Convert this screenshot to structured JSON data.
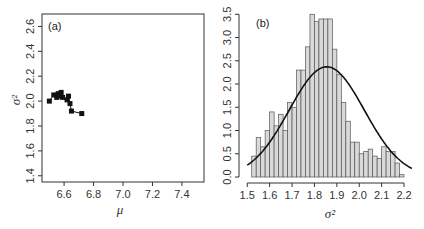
{
  "chart_data": [
    {
      "type": "scatter",
      "panel_label": "(a)",
      "title": "",
      "xlabel": "μ",
      "ylabel": "σ²",
      "xlim": [
        6.45,
        7.55
      ],
      "ylim": [
        1.35,
        2.7
      ],
      "xticks": [
        6.6,
        6.8,
        7.0,
        7.2,
        7.4
      ],
      "xtick_labels": [
        "6.6",
        "6.8",
        "7.0",
        "7.2",
        "7.4"
      ],
      "yticks": [
        1.4,
        1.6,
        1.8,
        2.0,
        2.2,
        2.4,
        2.6
      ],
      "ytick_labels": [
        "1.4",
        "1.6",
        "1.8",
        "2.0",
        "2.2",
        "2.4",
        "2.6"
      ],
      "grid": false,
      "marker": "square",
      "connected": true,
      "points": [
        {
          "x": 6.5,
          "y": 2.0
        },
        {
          "x": 6.53,
          "y": 2.05
        },
        {
          "x": 6.55,
          "y": 2.03
        },
        {
          "x": 6.56,
          "y": 2.06
        },
        {
          "x": 6.57,
          "y": 2.04
        },
        {
          "x": 6.58,
          "y": 2.07
        },
        {
          "x": 6.59,
          "y": 2.03
        },
        {
          "x": 6.62,
          "y": 2.01
        },
        {
          "x": 6.63,
          "y": 2.04
        },
        {
          "x": 6.64,
          "y": 1.98
        },
        {
          "x": 6.65,
          "y": 1.92
        },
        {
          "x": 6.72,
          "y": 1.9
        }
      ]
    },
    {
      "type": "bar",
      "subtype": "histogram",
      "panel_label": "(b)",
      "title": "",
      "xlabel": "σ²",
      "ylabel": "",
      "xlim": [
        1.49,
        2.24
      ],
      "ylim": [
        0,
        3.55
      ],
      "xticks": [
        1.5,
        1.6,
        1.7,
        1.8,
        1.9,
        2.0,
        2.1,
        2.2
      ],
      "xtick_labels": [
        "1.5",
        "1.6",
        "1.7",
        "1.8",
        "1.9",
        "2.0",
        "2.1",
        "2.2"
      ],
      "yticks": [
        0.0,
        0.5,
        1.0,
        1.5,
        2.0,
        2.5,
        3.0,
        3.5
      ],
      "ytick_labels": [
        "0.0",
        "0.5",
        "1.0",
        "1.5",
        "2.0",
        "2.5",
        "3.0",
        "3.5"
      ],
      "grid": false,
      "bin_start": 1.52,
      "bin_width": 0.02,
      "values": [
        0.45,
        0.85,
        0.65,
        1.0,
        1.4,
        1.1,
        1.35,
        1.0,
        1.6,
        1.5,
        2.3,
        2.3,
        2.8,
        3.5,
        3.35,
        3.4,
        3.4,
        3.4,
        2.75,
        2.2,
        1.6,
        1.2,
        0.75,
        0.75,
        0.5,
        0.55,
        0.6,
        0.45,
        0.4,
        0.65,
        0.55,
        0.55,
        0.3,
        0.05
      ],
      "bar_fill": "#d9d9d9",
      "bar_stroke": "#555555",
      "overlay_curve": {
        "type": "normal_density",
        "mean": 1.855,
        "sd": 0.168,
        "peak": 2.37,
        "color": "#111111"
      }
    }
  ]
}
